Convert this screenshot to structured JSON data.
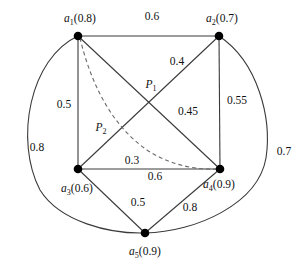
{
  "figure": {
    "type": "graph-diagram",
    "background": "#ffffff",
    "stroke_color": "#3a3a3a",
    "dashed_stroke_color": "#6b6b6b",
    "node_color": "#000000",
    "width": 305,
    "height": 268
  },
  "nodes": [
    {
      "id": "a1",
      "label": "a1(0.8)",
      "name": "a",
      "sub": "1",
      "value": "(0.8)",
      "x": 78,
      "y": 36,
      "label_x": 80,
      "label_y": 20
    },
    {
      "id": "a2",
      "label": "a2(0.7)",
      "name": "a",
      "sub": "2",
      "value": "(0.7)",
      "x": 219,
      "y": 36,
      "label_x": 222,
      "label_y": 20
    },
    {
      "id": "a3",
      "label": "a3(0.6)",
      "name": "a",
      "sub": "3",
      "value": "(0.6)",
      "x": 78,
      "y": 169,
      "label_x": 77,
      "label_y": 190
    },
    {
      "id": "a4",
      "label": "a4(0.9)",
      "name": "a",
      "sub": "4",
      "value": "(0.9)",
      "x": 220,
      "y": 169,
      "label_x": 219,
      "label_y": 186
    },
    {
      "id": "a5",
      "label": "a5(0.9)",
      "name": "a",
      "sub": "5",
      "value": "(0.9)",
      "x": 145,
      "y": 233,
      "label_x": 145,
      "label_y": 253
    }
  ],
  "points": [
    {
      "id": "P1",
      "name": "P",
      "sub": "1",
      "x": 151,
      "y": 86
    },
    {
      "id": "P2",
      "name": "P",
      "sub": "2",
      "x": 101,
      "y": 129
    }
  ],
  "edges": [
    {
      "id": "a1-a2",
      "from": "a1",
      "to": "a2",
      "weight": "0.6",
      "style": "straight",
      "label_x": 152,
      "label_y": 17
    },
    {
      "id": "a1-a3",
      "from": "a1",
      "to": "a3",
      "weight": "0.5",
      "style": "straight",
      "label_x": 64,
      "label_y": 105
    },
    {
      "id": "a2-a4",
      "from": "a2",
      "to": "a4",
      "weight": "0.55",
      "style": "straight",
      "label_x": 237,
      "label_y": 101
    },
    {
      "id": "a3-a4",
      "from": "a3",
      "to": "a4",
      "weight": "0.6",
      "style": "straight",
      "label_x": 155,
      "label_y": 177
    },
    {
      "id": "a1-a4",
      "from": "a1",
      "to": "a4",
      "weight": "0.45",
      "style": "straight",
      "label_x": 188,
      "label_y": 112
    },
    {
      "id": "a2-a3",
      "from": "a2",
      "to": "a3",
      "weight": "0.4",
      "style": "straight",
      "label_x": 177,
      "label_y": 62
    },
    {
      "id": "a3-a5",
      "from": "a3",
      "to": "a5",
      "weight": "0.5",
      "style": "straight",
      "label_x": 138,
      "label_y": 203
    },
    {
      "id": "a4-a5",
      "from": "a4",
      "to": "a5",
      "weight": "0.8",
      "style": "straight",
      "label_x": 190,
      "label_y": 208
    },
    {
      "id": "a1-a5-outer",
      "from": "a1",
      "to": "a5",
      "weight": "0.8",
      "style": "curved-outer-left",
      "label_x": 37,
      "label_y": 148
    },
    {
      "id": "a2-a5-outer",
      "from": "a2",
      "to": "a5",
      "weight": "0.7",
      "style": "curved-outer-right",
      "label_x": 284,
      "label_y": 152
    },
    {
      "id": "a1-a4-dashed",
      "from": "a1",
      "to": "a4",
      "weight": "0.3",
      "style": "dashed-curve",
      "label_x": 132,
      "label_y": 161
    }
  ]
}
